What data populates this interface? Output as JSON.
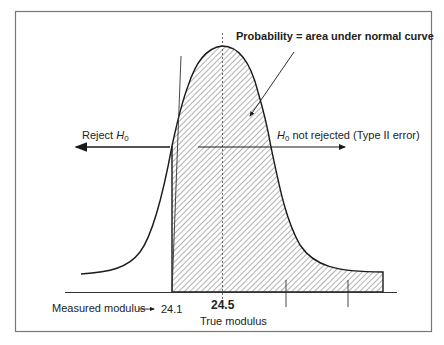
{
  "diagram": {
    "title": "Probability = area under normal curve",
    "labels": {
      "reject": {
        "text": "Reject ",
        "symbol": "H",
        "subscript": "0"
      },
      "not_rejected": {
        "symbol": "H",
        "subscript": "0",
        "text": " not rejected (Type II error)"
      },
      "measured_modulus": "Measured modulus",
      "measured_value": "24.1",
      "true_value": "24.5",
      "true_modulus": "True modulus"
    },
    "colors": {
      "line": "#1a1a1a",
      "frame": "#777777",
      "hatch": "#555555",
      "background": "#ffffff"
    },
    "curve": {
      "type": "normal-distribution",
      "mean": 24.5,
      "critical_value": 24.1,
      "shaded_region": "right of 24.1 (Type II error probability)"
    },
    "axis_ticks_unlabeled": 2
  }
}
